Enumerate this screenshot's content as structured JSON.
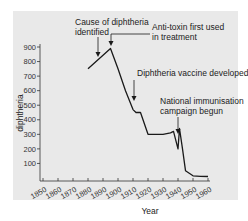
{
  "chart_data": {
    "type": "line",
    "title": "",
    "xlabel": "Year",
    "ylabel": "diphtheria",
    "xlim": [
      1850,
      1960
    ],
    "ylim": [
      0,
      900
    ],
    "grid": false,
    "legend": null,
    "x_ticks": [
      "1850",
      "1860",
      "1870",
      "1880",
      "1890",
      "1900",
      "1910",
      "1920",
      "1930",
      "1940",
      "1950",
      "1960"
    ],
    "y_ticks": [
      "100",
      "200",
      "300",
      "400",
      "500",
      "600",
      "700",
      "800",
      "900"
    ],
    "series": [
      {
        "name": "diphtheria",
        "x": [
          1880,
          1895,
          1900,
          1905,
          1910,
          1912,
          1915,
          1920,
          1925,
          1930,
          1935,
          1937,
          1940,
          1941,
          1943,
          1945,
          1950,
          1955,
          1960
        ],
        "y": [
          750,
          890,
          750,
          600,
          470,
          450,
          450,
          300,
          300,
          300,
          310,
          320,
          200,
          340,
          200,
          50,
          15,
          12,
          10
        ]
      }
    ],
    "annotations": [
      {
        "text": "Cause of diphtheria identified",
        "x": 1883,
        "y": 780
      },
      {
        "text": "Anti-toxin first used in treatment",
        "x": 1894,
        "y": 890
      },
      {
        "text": "Diphtheria vaccine developed",
        "x": 1913,
        "y": 450
      },
      {
        "text": "National immunisation campaign begun",
        "x": 1941,
        "y": 340
      }
    ]
  },
  "labels": {
    "xlabel": "Year",
    "ylabel": "diphtheria",
    "annot1_line1": "Cause of diphtheria",
    "annot1_line2": "identified",
    "annot2_line1": "Anti-toxin first used",
    "annot2_line2": "in treatment",
    "annot3": "Diphtheria vaccine developed",
    "annot4_line1": "National immunisation",
    "annot4_line2": "campaign begun"
  },
  "colors": {
    "panel": "#e9e9e9",
    "line": "#1a1a1a",
    "text": "#222222"
  }
}
